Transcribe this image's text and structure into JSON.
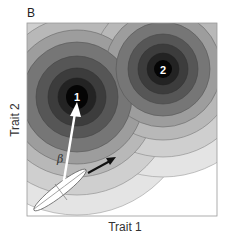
{
  "figure": {
    "panel_label": "B",
    "x_axis_label": "Trait 1",
    "y_axis_label": "Trait 2",
    "peaks": [
      {
        "label": "1",
        "cx": 77,
        "cy": 97
      },
      {
        "label": "2",
        "cx": 163,
        "cy": 69
      }
    ],
    "selection_gradient_label": "β",
    "contour_colors": [
      "#ffffff",
      "#e6e6e6",
      "#d2d2d2",
      "#b4b4b4",
      "#8c8c8c",
      "#636363",
      "#3e3e3e",
      "#1f1f1f",
      "#050505"
    ],
    "arrows": [
      {
        "name": "selection-gradient-arrow",
        "color": "#ffffff",
        "description": "white arrow from population mean toward peak 1"
      },
      {
        "name": "response-arrow",
        "color": "#111111",
        "description": "black arrow from population mean along G-matrix major axis"
      }
    ],
    "ellipse": {
      "description": "G-matrix ellipse at population mean",
      "fill": "#ffffff"
    }
  }
}
